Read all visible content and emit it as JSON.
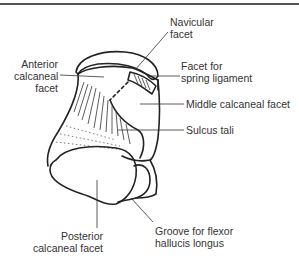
{
  "figure": {
    "labels": {
      "navicular_facet": [
        "Navicular",
        "facet"
      ],
      "anterior_calcaneal_facet": [
        "Anterior",
        "calcaneal",
        "facet"
      ],
      "facet_spring_ligament": [
        "Facet for",
        "spring ligament"
      ],
      "middle_calcaneal_facet": [
        "Middle calcaneal facet"
      ],
      "sulcus_tali": [
        "Sulcus tali"
      ],
      "posterior_calcaneal_facet": [
        "Posterior",
        "calcaneal facet"
      ],
      "groove_fhl": [
        "Groove for flexor",
        "hallucis longus"
      ]
    },
    "colors": {
      "line": "#222222",
      "rule": "#555555",
      "text": "#333333"
    }
  }
}
